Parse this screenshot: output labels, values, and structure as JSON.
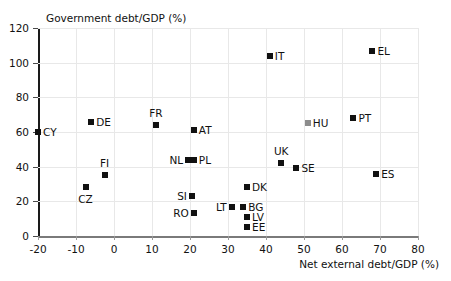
{
  "chart_data": {
    "type": "scatter",
    "title": "",
    "ylabel": "Government debt/GDP (%)",
    "xlabel": "Net external debt/GDP (%)",
    "xlim": [
      -20,
      80
    ],
    "ylim": [
      0,
      120
    ],
    "xticks": [
      -20,
      -10,
      0,
      10,
      20,
      30,
      40,
      50,
      60,
      70,
      80
    ],
    "yticks": [
      0,
      20,
      40,
      60,
      80,
      100,
      120
    ],
    "grid": true,
    "legend": "none",
    "marker": "square",
    "default_color": "#111111",
    "points": [
      {
        "label": "CY",
        "x": -20,
        "y": 60,
        "label_pos": "right",
        "color": "#111111"
      },
      {
        "label": "DE",
        "x": -6,
        "y": 66,
        "label_pos": "right",
        "color": "#111111"
      },
      {
        "label": "CZ",
        "x": -7.5,
        "y": 28,
        "label_pos": "below",
        "color": "#111111"
      },
      {
        "label": "FI",
        "x": -2.5,
        "y": 35,
        "label_pos": "above",
        "color": "#111111"
      },
      {
        "label": "FR",
        "x": 11,
        "y": 64,
        "label_pos": "above",
        "color": "#111111"
      },
      {
        "label": "AT",
        "x": 21,
        "y": 61,
        "label_pos": "right",
        "color": "#111111"
      },
      {
        "label": "NL",
        "x": 19.5,
        "y": 44,
        "label_pos": "left",
        "color": "#111111"
      },
      {
        "label": "PL",
        "x": 21,
        "y": 44,
        "label_pos": "right",
        "color": "#111111"
      },
      {
        "label": "SI",
        "x": 20.5,
        "y": 23,
        "label_pos": "left",
        "color": "#111111"
      },
      {
        "label": "RO",
        "x": 21,
        "y": 13,
        "label_pos": "left",
        "color": "#111111"
      },
      {
        "label": "LT",
        "x": 31,
        "y": 17,
        "label_pos": "left",
        "color": "#111111"
      },
      {
        "label": "BG",
        "x": 34,
        "y": 17,
        "label_pos": "right",
        "color": "#111111"
      },
      {
        "label": "DK",
        "x": 35,
        "y": 28,
        "label_pos": "right",
        "color": "#111111"
      },
      {
        "label": "LV",
        "x": 35,
        "y": 11,
        "label_pos": "right",
        "color": "#111111"
      },
      {
        "label": "EE",
        "x": 35,
        "y": 5,
        "label_pos": "right",
        "color": "#111111"
      },
      {
        "label": "IT",
        "x": 41,
        "y": 104,
        "label_pos": "right",
        "color": "#111111"
      },
      {
        "label": "UK",
        "x": 44,
        "y": 42,
        "label_pos": "above",
        "color": "#111111"
      },
      {
        "label": "SE",
        "x": 48,
        "y": 39,
        "label_pos": "right",
        "color": "#111111"
      },
      {
        "label": "HU",
        "x": 51,
        "y": 65,
        "label_pos": "right",
        "color": "#8c8c8c"
      },
      {
        "label": "PT",
        "x": 63,
        "y": 68,
        "label_pos": "right",
        "color": "#111111"
      },
      {
        "label": "EL",
        "x": 68,
        "y": 107,
        "label_pos": "right",
        "color": "#111111"
      },
      {
        "label": "ES",
        "x": 69,
        "y": 36,
        "label_pos": "right",
        "color": "#111111"
      }
    ]
  }
}
